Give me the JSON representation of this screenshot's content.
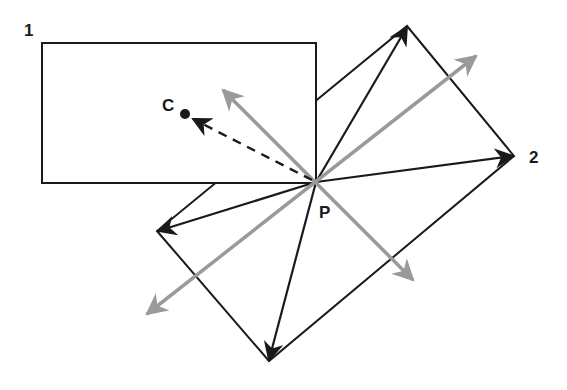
{
  "labels": {
    "rect1": "1",
    "rect2": "2",
    "center": "C",
    "point": "P"
  },
  "colors": {
    "background": "#ffffff",
    "black_arrows": "#1a1a1a",
    "gray_arrows": "#9a9a9a"
  },
  "geometry": {
    "rect1": {
      "x": 42,
      "y": 43,
      "width": 274,
      "height": 140
    },
    "rotated_rect_corners": {
      "top": [
        407,
        26
      ],
      "right": [
        514,
        156
      ],
      "bottom": [
        269,
        361
      ],
      "left": [
        157,
        231
      ]
    },
    "point_P": [
      316,
      182
    ],
    "point_C": [
      185,
      114
    ]
  }
}
